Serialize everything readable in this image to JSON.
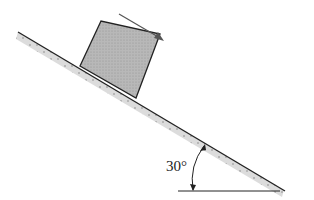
{
  "diagram": {
    "angle_label": "30°",
    "angle_degrees": 30,
    "elements": [
      "incline",
      "block",
      "motion-arrow",
      "horizontal-reference",
      "angle-arc"
    ],
    "colors": {
      "line": "#222222",
      "block_fill": "#b5b5b5",
      "incline_fill": "#d8d8d8",
      "arrow": "#555555"
    }
  }
}
